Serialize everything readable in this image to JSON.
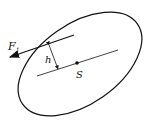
{
  "diagram": {
    "type": "rigid-body-force-moment",
    "labels": {
      "force": "F",
      "force_subscript": "1",
      "distance": "h",
      "center": "S"
    },
    "colors": {
      "stroke": "#111111",
      "background": "#ffffff"
    }
  }
}
